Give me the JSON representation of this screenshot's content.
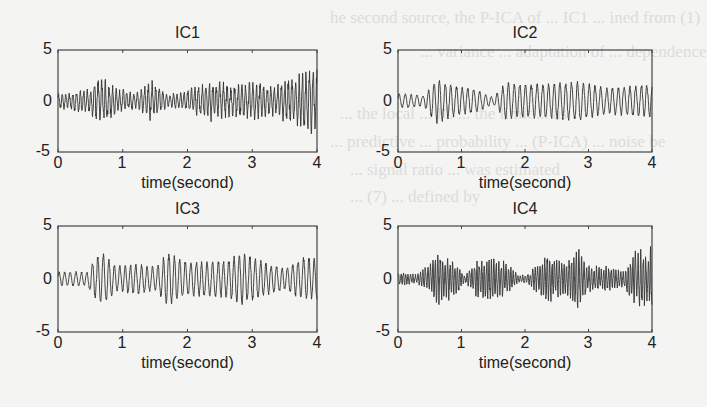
{
  "figure": {
    "background_color": "#f4f4f2",
    "line_color": "#333333",
    "bleed_through_text": [
      "he second source, the P-ICA of ... IC1 ... ined from (1)",
      "... variance ... adaptation of ... dependence",
      "... the local ... IC ... the limit ... as",
      "... predictive ... probability ... (P-ICA) ... noise be",
      "... signal ratio ... was estimated",
      "... (7) ... defined by"
    ]
  },
  "chart_data": [
    {
      "type": "line",
      "title": "IC1",
      "xlabel": "time(second)",
      "ylabel": "",
      "xlim": [
        0,
        4
      ],
      "ylim": [
        -5,
        5
      ],
      "xticks": [
        "0",
        "1",
        "2",
        "3",
        "4"
      ],
      "yticks": [
        "5",
        "0",
        "-5"
      ],
      "grid": false,
      "description": "broadband noisy oscillation around 0, amplitude ~1-2, bursts near 0.6s, 1.4s, 2.4s, and strong near 3.6-4s",
      "envelope": {
        "t": [
          0,
          0.5,
          0.65,
          0.9,
          1.2,
          1.45,
          1.7,
          1.9,
          2.4,
          2.7,
          3.0,
          3.3,
          3.6,
          3.9,
          4.0
        ],
        "amp": [
          0.7,
          1.2,
          2.4,
          1.3,
          0.8,
          2.0,
          0.6,
          0.9,
          2.0,
          1.5,
          1.9,
          1.4,
          2.3,
          3.0,
          3.0
        ]
      },
      "freq_hz": 18
    },
    {
      "type": "line",
      "title": "IC2",
      "xlabel": "time(second)",
      "ylabel": "",
      "xlim": [
        0,
        4
      ],
      "ylim": [
        -5,
        5
      ],
      "xticks": [
        "0",
        "1",
        "2",
        "3",
        "4"
      ],
      "yticks": [
        "5",
        "0",
        "-5"
      ],
      "grid": false,
      "description": "quasi-sinusoidal oscillation ~10 Hz with slow amplitude modulation, amplitude ~1-2.5",
      "envelope": {
        "t": [
          0,
          0.4,
          0.6,
          0.9,
          1.2,
          1.5,
          1.7,
          2.0,
          2.4,
          2.8,
          3.0,
          3.3,
          3.7,
          4.0
        ],
        "amp": [
          0.9,
          0.6,
          2.5,
          1.7,
          1.4,
          0.4,
          2.1,
          1.9,
          2.0,
          2.2,
          2.0,
          1.5,
          1.7,
          2.0
        ]
      },
      "freq_hz": 11
    },
    {
      "type": "line",
      "title": "IC3",
      "xlabel": "time(second)",
      "ylabel": "",
      "xlim": [
        0,
        4
      ],
      "ylim": [
        -5,
        5
      ],
      "xticks": [
        "0",
        "1",
        "2",
        "3",
        "4"
      ],
      "yticks": [
        "5",
        "0",
        "-5"
      ],
      "grid": false,
      "description": "oscillation ~10-12 Hz, amplitude ~1-3, peaks near 0.65s (-3), 1.7s (+3), 2.85s (-3), 3.8s",
      "envelope": {
        "t": [
          0,
          0.45,
          0.65,
          0.9,
          1.2,
          1.5,
          1.7,
          2.0,
          2.3,
          2.6,
          2.85,
          3.2,
          3.5,
          3.8,
          4.0
        ],
        "amp": [
          0.8,
          0.8,
          3.0,
          1.4,
          1.7,
          1.3,
          2.9,
          1.8,
          2.0,
          2.0,
          2.9,
          1.8,
          1.2,
          2.4,
          2.3
        ]
      },
      "freq_hz": 12
    },
    {
      "type": "line",
      "title": "IC4",
      "xlabel": "time(second)",
      "ylabel": "",
      "xlim": [
        0,
        4
      ],
      "ylim": [
        -5,
        5
      ],
      "xticks": [
        "0",
        "1",
        "2",
        "3",
        "4"
      ],
      "yticks": [
        "5",
        "0",
        "-5"
      ],
      "grid": false,
      "description": "high-frequency (~25 Hz) bursty oscillation with spindle-like envelopes near 0.65s, 1.45s, 2.35s, 2.85s, 3.7s",
      "envelope": {
        "t": [
          0,
          0.3,
          0.65,
          0.95,
          1.05,
          1.2,
          1.45,
          1.7,
          1.9,
          2.05,
          2.35,
          2.6,
          2.85,
          3.0,
          3.3,
          3.55,
          3.75,
          3.95,
          4.0
        ],
        "amp": [
          0.7,
          0.4,
          2.4,
          1.4,
          0.3,
          1.5,
          2.1,
          1.6,
          0.3,
          0.5,
          2.3,
          1.4,
          3.0,
          1.2,
          1.2,
          0.7,
          2.9,
          2.2,
          3.5
        ]
      },
      "freq_hz": 26
    }
  ]
}
